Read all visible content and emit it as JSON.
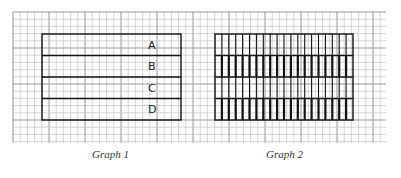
{
  "grid": {
    "x0": 13,
    "y0": 12,
    "x1": 386,
    "y1": 143,
    "cell": 7.2,
    "major_every": 5,
    "minor_color": "#b8b8b8",
    "major_color": "#8a8a8a"
  },
  "graphs": [
    {
      "caption": "Graph 1",
      "rect": {
        "x": 42,
        "y": 34,
        "w": 139,
        "h": 86
      },
      "rows": 4,
      "row_labels": [
        "A",
        "B",
        "C",
        "D"
      ],
      "label_x": 148,
      "vertical_lines": 0
    },
    {
      "caption": "Graph 2",
      "rect": {
        "x": 215,
        "y": 34,
        "w": 138,
        "h": 86
      },
      "rows": 4,
      "row_labels": [],
      "vertical_lines": 20,
      "bold_rows": [
        1,
        3
      ]
    }
  ],
  "captions": {
    "graph1": "Graph 1",
    "graph2": "Graph 2"
  },
  "colors": {
    "ink": "#111111",
    "background": "#ffffff"
  }
}
